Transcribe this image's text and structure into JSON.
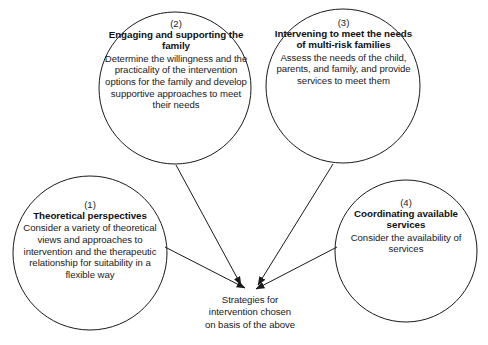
{
  "diagram": {
    "type": "convergence-flow",
    "outcome": {
      "lines": [
        "Strategies for",
        "intervention chosen",
        "on basis of the above"
      ]
    },
    "nodes": [
      {
        "id": "theoretical-perspectives",
        "number": "(1)",
        "title": "Theoretical perspectives",
        "body": "Consider a variety of theoretical views and approaches to intervention and the therapeutic relationship for suitability in a flexible way"
      },
      {
        "id": "engaging-supporting-family",
        "number": "(2)",
        "title": "Engaging and supporting the family",
        "body": "Determine the willingness and the practicality of the intervention options for the family and develop supportive approaches to meet their needs"
      },
      {
        "id": "intervening-multi-risk-families",
        "number": "(3)",
        "title": "Intervening to meet the needs of multi-risk families",
        "body": "Assess the needs of the child, parents, and family, and provide services to meet them"
      },
      {
        "id": "coordinating-available-services",
        "number": "(4)",
        "title": "Coordinating available services",
        "body": "Consider the availability of services"
      }
    ],
    "colors": {
      "stroke": "#1a1a1a",
      "text": "#1a1a1a",
      "background": "#ffffff"
    }
  }
}
